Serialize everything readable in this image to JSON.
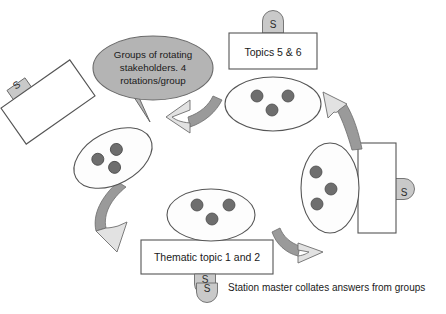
{
  "diagram": {
    "type": "process-cycle",
    "background_color": "#ffffff",
    "colors": {
      "outline": "#4a4a4a",
      "bubble_fill": "#b4b4b4",
      "badge_fill": "#c9c9c9",
      "dot_fill": "#6e6e6e",
      "arrow_light_fill": "#e0e0e0",
      "arrow_dark_fill": "#9a9a9a",
      "ellipse_fill": "#fdfdfd",
      "box_fill": "#ffffff",
      "text_color": "#1a1a1a"
    }
  },
  "callout": {
    "name": "speech-bubble",
    "line1": "Groups of rotating",
    "line2": "stakeholders. 4",
    "line3": "rotations/group",
    "full_text": "Groups of rotating stakeholders. 4 rotations/group"
  },
  "stations": [
    {
      "id": "station-top",
      "label": "Topics 5 & 6",
      "badge": "S",
      "badge_position": "top",
      "rotation_deg": 0
    },
    {
      "id": "station-left",
      "label": "",
      "badge": "S",
      "badge_position": "top-left",
      "rotation_deg": -35
    },
    {
      "id": "station-right",
      "label": "",
      "badge": "S",
      "badge_position": "right",
      "rotation_deg": 0
    },
    {
      "id": "station-bottom",
      "label": "Thematic topic 1 and 2",
      "badge": "S",
      "badge_position": "bottom",
      "rotation_deg": 0
    }
  ],
  "groups": [
    {
      "id": "group-top",
      "dots": 3,
      "rotation_deg": 0,
      "label": ""
    },
    {
      "id": "group-left",
      "dots": 3,
      "rotation_deg": -28,
      "label": ""
    },
    {
      "id": "group-right",
      "dots": 3,
      "rotation_deg": 0,
      "label": ""
    },
    {
      "id": "group-bottom",
      "dots": 3,
      "rotation_deg": 0,
      "label": ""
    }
  ],
  "rotation_arrows": [
    {
      "id": "arrow-top-to-left",
      "direction": "counter-clockwise",
      "points_to": "group-left"
    },
    {
      "id": "arrow-right-to-top",
      "direction": "counter-clockwise",
      "points_to": "group-top"
    },
    {
      "id": "arrow-left-to-bottom",
      "direction": "counter-clockwise",
      "points_to": "group-bottom"
    },
    {
      "id": "arrow-bottom-to-right",
      "direction": "counter-clockwise",
      "points_to": "group-right"
    }
  ],
  "legend": {
    "badge": "S",
    "text": "Station master collates answers from groups"
  }
}
